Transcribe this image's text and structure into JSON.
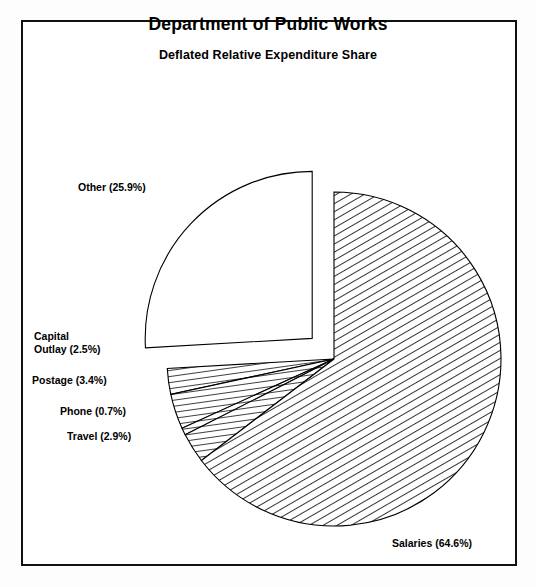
{
  "chart_data": {
    "type": "pie",
    "title": "Department of Public Works",
    "subtitle": "Deflated Relative Expenditure Share",
    "categories": [
      "Other",
      "Capital Outlay",
      "Postage",
      "Phone",
      "Travel",
      "Salaries"
    ],
    "values": [
      25.9,
      2.5,
      3.4,
      0.7,
      2.9,
      64.6
    ],
    "unit": "%",
    "labels": [
      "Other (25.9%)",
      "Capital\nOutlay (2.5%)",
      "Postage (3.4%)",
      "Phone (0.7%)",
      "Travel (2.9%)",
      "Salaries (64.6%)"
    ],
    "legend": "none",
    "grid": false,
    "exploded_slice": "Other",
    "fills": [
      "white",
      "hatch-horizontal",
      "hatch-horizontal",
      "hatch-horizontal",
      "hatch-horizontal",
      "hatch-diagonal"
    ],
    "colors": {
      "stroke": "#000000",
      "background": "#ffffff",
      "page": "#fdfdfd",
      "fill": "#ffffff"
    },
    "geometry": {
      "center_x": 334,
      "center_y": 359,
      "radius": 167,
      "start_angle_deg": -90,
      "explode_offset": 30
    }
  },
  "labels_layout": [
    {
      "name": "other",
      "x": 78,
      "y": 181,
      "align": "left"
    },
    {
      "name": "capital-outlay",
      "x": 34,
      "y": 330,
      "align": "left"
    },
    {
      "name": "postage",
      "x": 32,
      "y": 374,
      "align": "left"
    },
    {
      "name": "phone",
      "x": 60,
      "y": 405,
      "align": "left"
    },
    {
      "name": "travel",
      "x": 67,
      "y": 430,
      "align": "left"
    },
    {
      "name": "salaries",
      "x": 392,
      "y": 537,
      "align": "left"
    }
  ]
}
